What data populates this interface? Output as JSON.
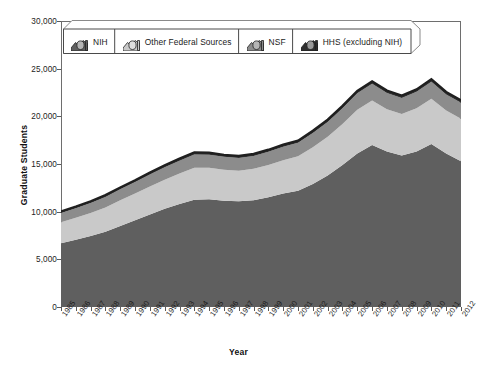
{
  "chart_data": {
    "type": "area",
    "stacked": true,
    "title": "",
    "xlabel": "Year",
    "ylabel": "Graduate Students",
    "ylim": [
      0,
      30000
    ],
    "y_ticks": [
      0,
      5000,
      10000,
      15000,
      20000,
      25000,
      30000
    ],
    "y_tick_labels": [
      "0",
      "5,000",
      "10,000",
      "15,000",
      "20,000",
      "25,000",
      "30,000"
    ],
    "grid": false,
    "legend_position": "top-left-inside",
    "categories": [
      "1985",
      "1986",
      "1987",
      "1988",
      "1989",
      "1990",
      "1991",
      "1992",
      "1993",
      "1994",
      "1995",
      "1996",
      "1997",
      "1998",
      "1999",
      "2000",
      "2001",
      "2002",
      "2003",
      "2004",
      "2005",
      "2006",
      "2007",
      "2008",
      "2009",
      "2010",
      "2011",
      "2012"
    ],
    "series": [
      {
        "name": "NIH",
        "color": "#5f5f5f",
        "values": [
          6700,
          7050,
          7450,
          7900,
          8500,
          9100,
          9700,
          10300,
          10800,
          11250,
          11300,
          11150,
          11100,
          11200,
          11500,
          11900,
          12200,
          12900,
          13800,
          14900,
          16100,
          17000,
          16300,
          15900,
          16300,
          17100,
          16100,
          15300
        ]
      },
      {
        "name": "Other Federal Sources",
        "color": "#c9c9c9",
        "values": [
          2200,
          2300,
          2400,
          2550,
          2700,
          2800,
          2950,
          3050,
          3200,
          3350,
          3300,
          3250,
          3200,
          3300,
          3400,
          3500,
          3600,
          3850,
          4050,
          4300,
          4600,
          4650,
          4450,
          4350,
          4550,
          4750,
          4500,
          4450
        ]
      },
      {
        "name": "NSF",
        "color": "#8c8c8c",
        "values": [
          950,
          1000,
          1050,
          1100,
          1150,
          1200,
          1250,
          1300,
          1350,
          1400,
          1380,
          1350,
          1330,
          1350,
          1380,
          1400,
          1420,
          1500,
          1560,
          1640,
          1720,
          1760,
          1700,
          1680,
          1720,
          1780,
          1700,
          1680
        ]
      },
      {
        "name": "HHS (excluding NIH)",
        "color": "#2e2e2e",
        "values": [
          180,
          185,
          190,
          195,
          200,
          205,
          210,
          215,
          220,
          225,
          220,
          215,
          215,
          218,
          222,
          228,
          232,
          240,
          248,
          255,
          262,
          265,
          258,
          255,
          260,
          268,
          258,
          255
        ]
      }
    ]
  },
  "legend": {
    "items": [
      {
        "label": "NIH",
        "swatch": "nih-swatch"
      },
      {
        "label": "Other Federal Sources",
        "swatch": "other-federal-swatch"
      },
      {
        "label": "NSF",
        "swatch": "nsf-swatch"
      },
      {
        "label": "HHS (excluding NIH)",
        "swatch": "hhs-swatch"
      }
    ]
  },
  "caption": {
    "text": ""
  }
}
